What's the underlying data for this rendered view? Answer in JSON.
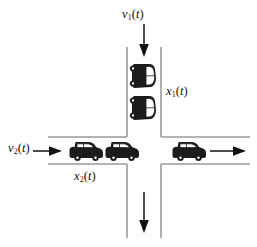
{
  "labels": {
    "inflow_vertical": {
      "symbol": "v",
      "subscript": "1",
      "argument": "(t)",
      "text": "v1(t)"
    },
    "queue_vertical": {
      "symbol": "x",
      "subscript": "1",
      "argument": "(t)",
      "text": "x1(t)"
    },
    "inflow_horizontal": {
      "symbol": "v",
      "subscript": "2",
      "argument": "(t)",
      "text": "v2(t)"
    },
    "queue_horizontal": {
      "symbol": "x",
      "subscript": "2",
      "argument": "(t)",
      "text": "x2(t)"
    }
  },
  "arrows": [
    {
      "name": "top-inflow-arrow",
      "direction": "down",
      "position": "top"
    },
    {
      "name": "left-inflow-arrow",
      "direction": "right",
      "position": "left"
    },
    {
      "name": "right-outflow-arrow",
      "direction": "right",
      "position": "right"
    },
    {
      "name": "bottom-outflow-arrow",
      "direction": "down",
      "position": "bottom"
    }
  ],
  "vehicles": {
    "vertical_queue_count": 2,
    "horizontal_queue_count": 2,
    "horizontal_departing_count": 1
  },
  "colors": {
    "road_line": "#9a9a9a",
    "car_body": "#1c1c1c",
    "car_glass": "#ffffff",
    "arrow": "#111111",
    "background": "#ffffff"
  }
}
